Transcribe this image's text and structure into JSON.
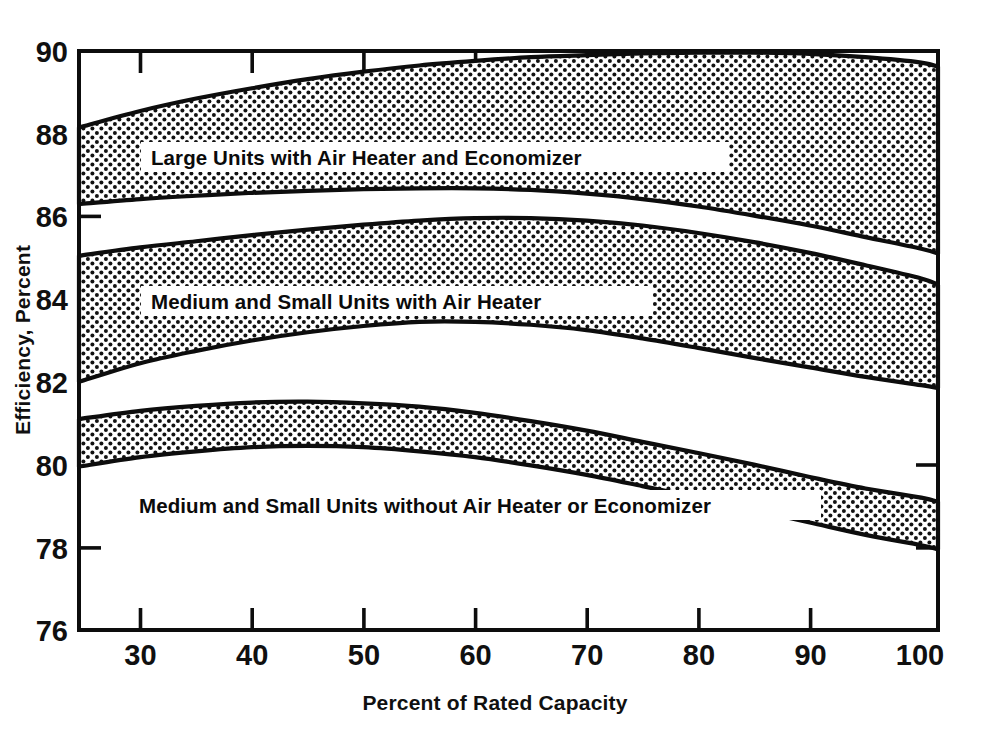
{
  "chart_data": {
    "type": "area",
    "title": "",
    "xlabel": "Percent of Rated Capacity",
    "ylabel": "Efficiency, Percent",
    "xlim": [
      24.5,
      101.5
    ],
    "ylim": [
      76,
      90
    ],
    "xticks": [
      30,
      40,
      50,
      60,
      70,
      80,
      90,
      100
    ],
    "yticks": [
      76,
      78,
      80,
      82,
      84,
      86,
      88,
      90
    ],
    "grid": false,
    "legend": "inline-band-labels",
    "fill_pattern": "dotted-stipple",
    "x": [
      24.5,
      30,
      35,
      40,
      45,
      50,
      55,
      60,
      65,
      70,
      75,
      80,
      85,
      90,
      95,
      100,
      101.5
    ],
    "series": [
      {
        "name": "Large Units with Air Heater and Economizer",
        "label": "Large Units with Air Heater and Economizer",
        "upper": [
          88.15,
          88.55,
          88.85,
          89.1,
          89.32,
          89.5,
          89.65,
          89.76,
          89.85,
          89.9,
          89.94,
          89.96,
          89.96,
          89.93,
          89.85,
          89.72,
          89.62
        ],
        "lower": [
          86.3,
          86.42,
          86.5,
          86.57,
          86.62,
          86.66,
          86.68,
          86.68,
          86.64,
          86.55,
          86.42,
          86.24,
          86.02,
          85.78,
          85.5,
          85.22,
          85.1
        ]
      },
      {
        "name": "Medium and Small Units with Air Heater",
        "label": "Medium and Small Units with Air Heater",
        "upper": [
          85.05,
          85.25,
          85.4,
          85.55,
          85.68,
          85.8,
          85.9,
          85.96,
          85.96,
          85.9,
          85.78,
          85.6,
          85.38,
          85.12,
          84.82,
          84.5,
          84.35
        ],
        "lower": [
          82.0,
          82.45,
          82.75,
          83.0,
          83.2,
          83.35,
          83.45,
          83.45,
          83.38,
          83.25,
          83.05,
          82.82,
          82.58,
          82.35,
          82.12,
          81.92,
          81.85
        ]
      },
      {
        "name": "Medium and Small Units without Air Heater or Economizer",
        "label": "Medium and Small Units without Air Heater or Economizer",
        "upper": [
          81.1,
          81.3,
          81.42,
          81.5,
          81.52,
          81.48,
          81.4,
          81.25,
          81.05,
          80.82,
          80.55,
          80.28,
          80.0,
          79.7,
          79.42,
          79.2,
          79.1
        ],
        "lower": [
          79.95,
          80.18,
          80.32,
          80.42,
          80.45,
          80.42,
          80.32,
          80.18,
          79.98,
          79.75,
          79.48,
          79.2,
          78.9,
          78.6,
          78.3,
          78.05,
          77.95
        ]
      }
    ]
  },
  "axes": {
    "y_title": "Efficiency, Percent",
    "x_title": "Percent of Rated Capacity",
    "y_tick_labels": [
      "90",
      "88",
      "86",
      "84",
      "82",
      "80",
      "78",
      "76"
    ],
    "x_tick_labels": [
      "30",
      "40",
      "50",
      "60",
      "70",
      "80",
      "90",
      "100"
    ]
  },
  "band_labels": {
    "top": "Large Units with Air Heater and Economizer",
    "middle": "Medium and Small Units with Air Heater",
    "bottom": "Medium and Small Units without Air Heater or Economizer"
  },
  "colors": {
    "ink": "#0d0d0d",
    "background": "#ffffff",
    "stipple": "#111111"
  }
}
